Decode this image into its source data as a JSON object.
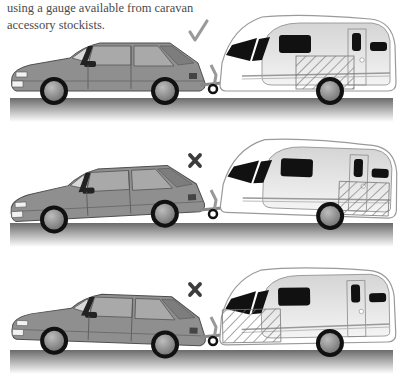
{
  "caption": {
    "lines": [
      "using a gauge available from caravan",
      "accessory stockists."
    ]
  },
  "colors": {
    "car_body": "#8f8f8f",
    "car_shadow": "#6f6f6f",
    "window_glass": "#a9a9a9",
    "caravan_body": "#e9e9e9",
    "caravan_outline": "#9a9a9a",
    "window_dark": "#111111",
    "road_top": "#6a6a6a",
    "road_bottom": "#ffffff",
    "symbol_ok": "#9a9a9a",
    "symbol_bad": "#3c3c3c",
    "hatch": "#7a7a7a"
  },
  "panels": [
    {
      "name": "correct-loading",
      "symbol": "tick",
      "symbol_text": "✓",
      "verdict": "correct",
      "load_position": "over-axle",
      "hitch_state": "level"
    },
    {
      "name": "tail-heavy-loading",
      "symbol": "cross",
      "symbol_text": "✗",
      "verdict": "incorrect",
      "load_position": "rear",
      "hitch_state": "nose-up"
    },
    {
      "name": "nose-heavy-loading",
      "symbol": "cross",
      "symbol_text": "✗",
      "verdict": "incorrect",
      "load_position": "front",
      "hitch_state": "nose-down"
    }
  ]
}
